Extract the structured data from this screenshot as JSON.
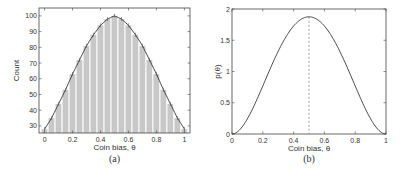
{
  "chart_data": [
    {
      "id": "a",
      "type": "bar",
      "caption": "(a)",
      "title": "",
      "xlabel": "Coin bias, θ",
      "ylabel": "Count",
      "xlim": [
        -0.04,
        1.04
      ],
      "ylim": [
        25.5,
        105
      ],
      "xticks": [
        0,
        0.2,
        0.4,
        0.6,
        0.8,
        1
      ],
      "xtick_labels": [
        "0",
        "0.2",
        "0.4",
        "0.6",
        "0.8",
        "1"
      ],
      "yticks": [
        30,
        40,
        50,
        60,
        70,
        80,
        90,
        100
      ],
      "ytick_labels": [
        "30",
        "40",
        "50",
        "60",
        "70",
        "80",
        "90",
        "100"
      ],
      "grid": false,
      "bar_color": "#c8c8c8",
      "categories": [
        0,
        0.05,
        0.1,
        0.15,
        0.2,
        0.25,
        0.3,
        0.35,
        0.4,
        0.45,
        0.5,
        0.55,
        0.6,
        0.65,
        0.7,
        0.75,
        0.8,
        0.85,
        0.9,
        0.95,
        1.0
      ],
      "values": [
        28,
        35,
        44,
        53,
        63,
        72,
        81,
        88,
        94,
        98,
        100,
        98,
        94,
        88,
        81,
        72,
        63,
        53,
        44,
        35,
        28
      ],
      "overlay": {
        "type": "line",
        "name": "fitted curve",
        "color": "#333333"
      }
    },
    {
      "id": "b",
      "type": "line",
      "caption": "(b)",
      "title": "",
      "xlabel": "Coin bias, θ",
      "ylabel": "p(θ)",
      "xlim": [
        0,
        1
      ],
      "ylim": [
        0,
        2
      ],
      "xticks": [
        0,
        0.2,
        0.4,
        0.6,
        0.8,
        1
      ],
      "xtick_labels": [
        "0",
        "0.2",
        "0.4",
        "0.6",
        "0.8",
        "1"
      ],
      "yticks": [
        0,
        0.5,
        1,
        1.5,
        2
      ],
      "ytick_labels": [
        "0",
        "0.5",
        "1",
        "1.5",
        "2"
      ],
      "grid": false,
      "series": [
        {
          "name": "p(θ)",
          "x": [
            0,
            0.05,
            0.1,
            0.15,
            0.2,
            0.25,
            0.3,
            0.35,
            0.4,
            0.45,
            0.5,
            0.55,
            0.6,
            0.65,
            0.7,
            0.75,
            0.8,
            0.85,
            0.9,
            0.95,
            1.0
          ],
          "values": [
            0,
            0.068,
            0.243,
            0.469,
            0.768,
            1.055,
            1.323,
            1.553,
            1.728,
            1.838,
            1.875,
            1.838,
            1.728,
            1.553,
            1.323,
            1.055,
            0.768,
            0.469,
            0.243,
            0.068,
            0
          ]
        }
      ],
      "annotations": [
        {
          "type": "vline",
          "x": 0.5,
          "style": "dashed",
          "to_y": 1.875
        }
      ]
    }
  ]
}
